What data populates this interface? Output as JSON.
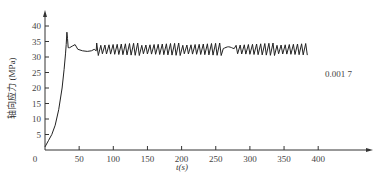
{
  "chart_data": {
    "type": "line",
    "title": "",
    "xlabel": "t(s)",
    "ylabel": "轴向应力 (MPa)",
    "xlim": [
      0,
      400
    ],
    "ylim": [
      0,
      40
    ],
    "x_ticks": [
      0,
      50,
      100,
      150,
      200,
      250,
      300,
      350,
      400
    ],
    "y_ticks": [
      5,
      10,
      15,
      20,
      25,
      30,
      35,
      40
    ],
    "grid": false,
    "legend": null,
    "annotations": [
      {
        "text": "0.001 7",
        "x": 400,
        "y": 32
      }
    ],
    "series": [
      {
        "name": "0.001 7",
        "color": "#222222",
        "points": [
          [
            0,
            1
          ],
          [
            5,
            3
          ],
          [
            10,
            5
          ],
          [
            15,
            8
          ],
          [
            20,
            13
          ],
          [
            25,
            20
          ],
          [
            28,
            26
          ],
          [
            30,
            31
          ],
          [
            31,
            34
          ],
          [
            32,
            38
          ],
          [
            33,
            36
          ],
          [
            34,
            33
          ],
          [
            36,
            33
          ],
          [
            40,
            33.5
          ],
          [
            44,
            34
          ],
          [
            48,
            32.5
          ],
          [
            55,
            32
          ],
          [
            62,
            31.8
          ],
          [
            68,
            32
          ],
          [
            72,
            32.5
          ],
          [
            75,
            32
          ]
        ],
        "oscillation": {
          "x_start": 75,
          "x_end": 385,
          "min": 30.5,
          "max": 34.5,
          "period_s": 6,
          "flat_segment": {
            "x_start": 258,
            "x_end": 278,
            "value": 33
          }
        }
      }
    ]
  },
  "axes": {
    "y_tick_labels": [
      "5",
      "10",
      "15",
      "20",
      "25",
      "30",
      "35",
      "40"
    ],
    "x_tick_labels": [
      "0",
      "50",
      "100",
      "150",
      "200",
      "250",
      "300",
      "350",
      "400"
    ],
    "x_title": "t(s)",
    "y_title": "轴向应力 (MPa)"
  },
  "curve_label": "0.001 7"
}
